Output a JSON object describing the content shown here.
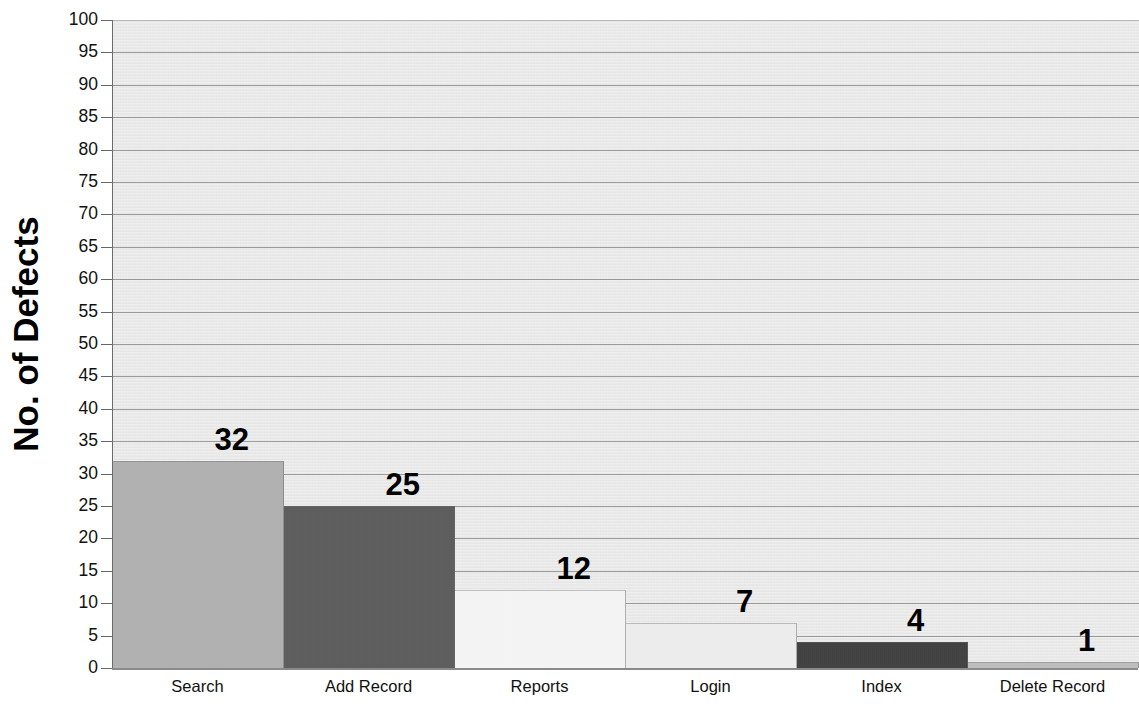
{
  "chart_data": {
    "type": "bar",
    "title": "",
    "subtitle": "",
    "xlabel": "",
    "ylabel": "No. of Defects",
    "categories": [
      "Search",
      "Add Record",
      "Reports",
      "Login",
      "Index",
      "Delete Record"
    ],
    "values": [
      32,
      25,
      12,
      7,
      4,
      1
    ],
    "data_labels": [
      "32",
      "25",
      "12",
      "7",
      "4",
      "1"
    ],
    "ylim": [
      0,
      100
    ],
    "ytick_step": 5,
    "ytick_labels": [
      "100",
      "95",
      "90",
      "85",
      "80",
      "75",
      "70",
      "65",
      "60",
      "55",
      "50",
      "45",
      "40",
      "35",
      "30",
      "25",
      "20",
      "15",
      "10",
      "5",
      "0"
    ],
    "grid": true,
    "grid_axis": "y",
    "legend": false,
    "legend_position": "none",
    "bar_colors": [
      "#b5b5b5",
      "#595959",
      "#ffffff",
      "#f7f7f7",
      "#3b3b3b",
      "#c3c3c3"
    ],
    "plot_background": "#e9e9e9",
    "gridline_color": "#9a9a9a",
    "axis_color": "#6b6b6b",
    "text_color": "#111111",
    "bar_gap": 0
  }
}
